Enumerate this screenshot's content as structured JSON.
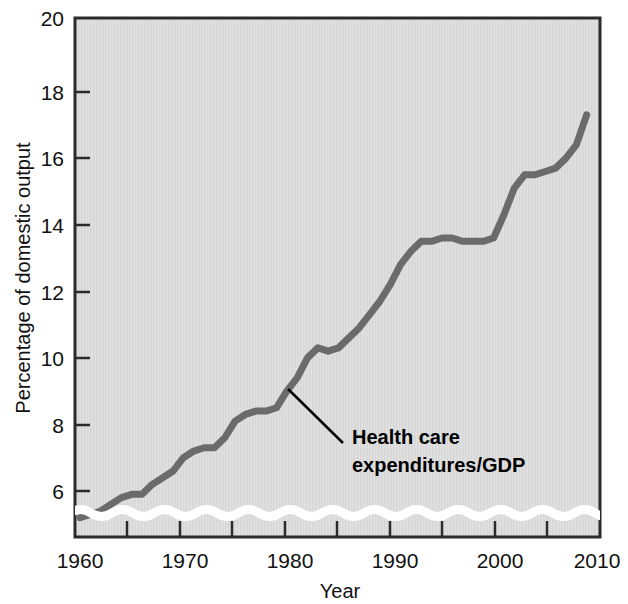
{
  "chart_data": {
    "type": "line",
    "title": "",
    "xlabel": "Year",
    "ylabel": "Percentage of domestic output",
    "xlim": [
      1960,
      2010
    ],
    "ylim": [
      5,
      20
    ],
    "ytick_labels": [
      "20",
      "18",
      "16",
      "14",
      "12",
      "10",
      "8",
      "6"
    ],
    "ytick_values": [
      20,
      18,
      16,
      14,
      12,
      10,
      8,
      6
    ],
    "xtick_labels": [
      "1960",
      "1970",
      "1980",
      "1990",
      "2000",
      "2010"
    ],
    "xtick_values": [
      1960,
      1970,
      1980,
      1990,
      2000,
      2010
    ],
    "xminor_ticks": [
      1965,
      1975,
      1985,
      1995,
      2005
    ],
    "grid": false,
    "legend": "none",
    "axis_break": true,
    "series": [
      {
        "name": "Health care expenditures/GDP",
        "color": "#6b6b6b",
        "x": [
          1960,
          1961,
          1962,
          1963,
          1964,
          1965,
          1966,
          1967,
          1968,
          1969,
          1970,
          1971,
          1972,
          1973,
          1974,
          1975,
          1976,
          1977,
          1978,
          1979,
          1980,
          1981,
          1982,
          1983,
          1984,
          1985,
          1986,
          1987,
          1988,
          1989,
          1990,
          1991,
          1992,
          1993,
          1994,
          1995,
          1996,
          1997,
          1998,
          1999,
          2000,
          2001,
          2002,
          2003,
          2004,
          2005,
          2006,
          2007,
          2008,
          2009
        ],
        "values": [
          5.2,
          5.3,
          5.4,
          5.6,
          5.8,
          5.9,
          5.9,
          6.2,
          6.4,
          6.6,
          7.0,
          7.2,
          7.3,
          7.3,
          7.6,
          8.1,
          8.3,
          8.4,
          8.4,
          8.5,
          9.0,
          9.4,
          10.0,
          10.3,
          10.2,
          10.3,
          10.6,
          10.9,
          11.3,
          11.7,
          12.2,
          12.8,
          13.2,
          13.5,
          13.5,
          13.6,
          13.6,
          13.5,
          13.5,
          13.5,
          13.6,
          14.3,
          15.1,
          15.5,
          15.5,
          15.6,
          15.7,
          16.0,
          16.4,
          17.3
        ]
      }
    ],
    "annotation": {
      "line1": "Health care",
      "line2": "expenditures/GDP",
      "points_to_year": 1980,
      "points_to_value": 8.5
    }
  },
  "axis": {
    "y_title": "Percentage of domestic output",
    "x_title": "Year"
  }
}
